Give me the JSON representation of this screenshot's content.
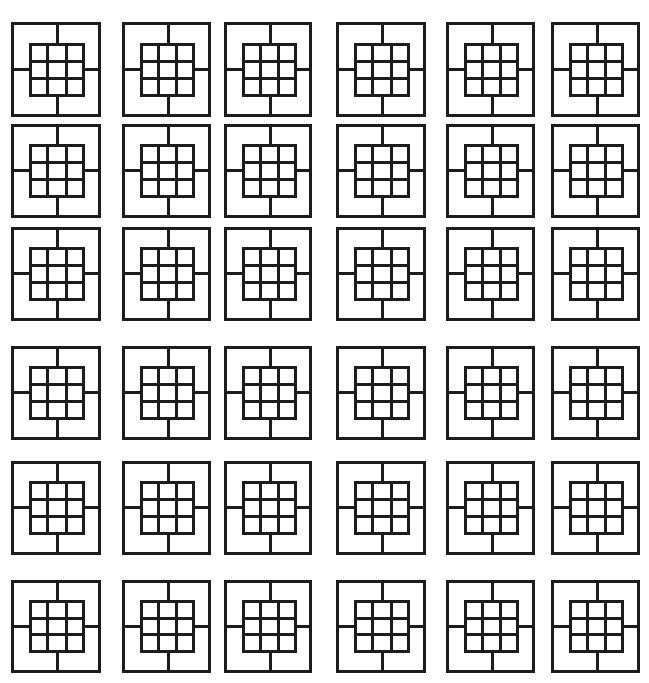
{
  "figure": {
    "rows": 6,
    "cols": 6,
    "tile_count": 36,
    "stroke_color": "#1c1c1c",
    "background_color": "#ffffff",
    "inner_grid": {
      "rows": 3,
      "cols": 3
    },
    "spokes": [
      "top",
      "right",
      "bottom",
      "left"
    ]
  },
  "layout": {
    "col_x": [
      11,
      122,
      224,
      336,
      446,
      551
    ],
    "col_w": [
      90,
      89,
      88,
      90,
      89,
      89
    ],
    "row_y": [
      22,
      124,
      227,
      346,
      461,
      580
    ],
    "row_h": [
      95,
      94,
      94,
      94,
      94,
      93
    ]
  }
}
